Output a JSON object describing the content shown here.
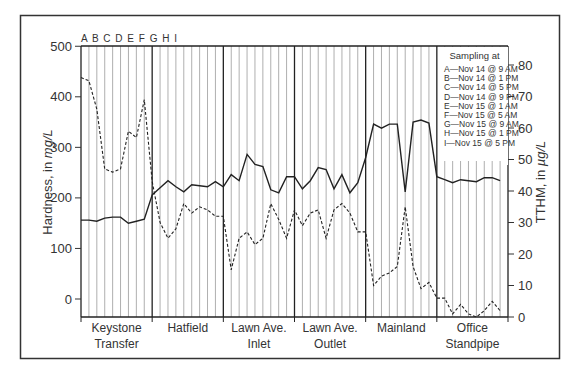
{
  "chart_data": {
    "type": "line",
    "title": "",
    "xlabel": "",
    "ylabel": "Hardness, in mg/L",
    "ylabel_parts": [
      "Hardness, in ",
      "mg/L"
    ],
    "y2label": "TTHM, in µg/L",
    "y2label_parts": [
      "TTHM, in ",
      "µg/L"
    ],
    "ylim": [
      -35,
      500
    ],
    "y2lim": [
      0,
      85
    ],
    "yticks": [
      0,
      100,
      200,
      300,
      400,
      500
    ],
    "y2ticks": [
      0,
      10,
      20,
      30,
      40,
      50,
      60,
      70,
      80
    ],
    "grid": "vertical lines at each sampling time",
    "sampling_letters": "A B C D E F G H I",
    "categories": [
      "Keystone Transfer",
      "Hatfield",
      "Lawn Ave. Inlet",
      "Lawn Ave. Outlet",
      "Mainland",
      "Office Standpipe"
    ],
    "category_lines": [
      [
        "Keystone",
        "Transfer"
      ],
      [
        "Hatfield"
      ],
      [
        "Lawn Ave.",
        "Inlet"
      ],
      [
        "Lawn Ave.",
        "Outlet"
      ],
      [
        "Mainland"
      ],
      [
        "Office",
        "Standpipe"
      ]
    ],
    "sampling_times": [
      "A",
      "B",
      "C",
      "D",
      "E",
      "F",
      "G",
      "H",
      "I"
    ],
    "series": [
      {
        "name": "Hardness (mg/L)",
        "axis": "left",
        "style": "solid",
        "values": [
          [
            156,
            156,
            154,
            160,
            162,
            162,
            150,
            154,
            158
          ],
          [
            206,
            220,
            234,
            222,
            212,
            226,
            224,
            222,
            232
          ],
          [
            222,
            246,
            234,
            286,
            266,
            262,
            216,
            210,
            242
          ],
          [
            242,
            218,
            234,
            260,
            256,
            218,
            246,
            210,
            230
          ],
          [
            280,
            346,
            338,
            346,
            346,
            212,
            350,
            354,
            348
          ],
          [
            242,
            236,
            230,
            236,
            234,
            232,
            240,
            240,
            234
          ]
        ]
      },
      {
        "name": "TTHM (µg/L)",
        "axis": "right",
        "style": "dashed",
        "values": [
          [
            76,
            75,
            66,
            47,
            46,
            47,
            59,
            57,
            69
          ],
          [
            43,
            30,
            25,
            28,
            36,
            33,
            35,
            34,
            32
          ],
          [
            32,
            15,
            25,
            27,
            23,
            25,
            36,
            31,
            25
          ],
          [
            34,
            29,
            33,
            34,
            25,
            34,
            36,
            33,
            27
          ],
          [
            27,
            10,
            13,
            14,
            16,
            35,
            16,
            9,
            11
          ],
          [
            6,
            6,
            1,
            4,
            1,
            0,
            2,
            5,
            2
          ]
        ]
      }
    ],
    "legend": {
      "title": "Sampling at",
      "position": "top-right inside plot",
      "items": [
        "A—Nov 14 @ 9 AM",
        "B—Nov 14 @ 1 PM",
        "C—Nov 14 @ 5 PM",
        "D—Nov 14 @ 9 PM",
        "E—Nov 15 @ 1 AM",
        "F—Nov 15 @ 5 AM",
        "G—Nov 15 @ 9 AM",
        "H—Nov 15 @ 1 PM",
        "I—Nov 15 @ 5 PM"
      ]
    }
  },
  "colors": {
    "line": "#222222",
    "grid": "#9a9a9a",
    "frame": "#333333",
    "legend_bg": "#ffffff"
  }
}
